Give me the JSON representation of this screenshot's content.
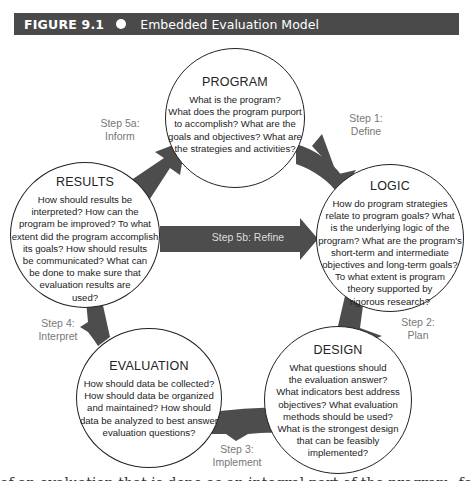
{
  "header": {
    "figure_label": "FIGURE 9.1",
    "bullet_icon": "circle-bullet",
    "title": "Embedded Evaluation Model",
    "background_color": "#4a4a4a"
  },
  "nodes": {
    "program": {
      "title": "PROGRAM",
      "lines": [
        "What is the program?",
        "What does the program purport",
        "to accomplish? What are the",
        "goals and objectives? What are",
        "the strategies and activities?"
      ]
    },
    "logic": {
      "title": "LOGIC",
      "lines": [
        "How do program strategies",
        "relate to program goals? What",
        "is the underlying logic of the",
        "program? What are the program's",
        "short-term and intermediate",
        "objectives and long-term goals?",
        "To what extent is program",
        "theory supported by",
        "rigorous research?"
      ]
    },
    "design": {
      "title": "DESIGN",
      "lines": [
        "What questions should",
        "the evaluation answer?",
        "What indicators best address",
        "objectives? What evaluation",
        "methods should be used?",
        "What is the strongest design",
        "that can be feasibly",
        "implemented?"
      ]
    },
    "evaluation": {
      "title": "EVALUATION",
      "lines": [
        "How should data be collected?",
        "How should data be organized",
        "and maintained? How should",
        "data be analyzed to best answer",
        "evaluation questions?"
      ]
    },
    "results": {
      "title": "RESULTS",
      "lines": [
        "How should results be",
        "interpreted? How can the",
        "program be improved? To what",
        "extent did the program accomplish",
        "its goals? How should results",
        "be communicated? What can",
        "be done to make sure that",
        "evaluation results are",
        "used?"
      ]
    }
  },
  "steps": {
    "step1": {
      "line1": "Step 1:",
      "line2": "Define"
    },
    "step2": {
      "line1": "Step 2:",
      "line2": "Plan"
    },
    "step3": {
      "line1": "Step 3:",
      "line2": "Implement"
    },
    "step4": {
      "line1": "Step 4:",
      "line2": "Interpret"
    },
    "step5a": {
      "line1": "Step 5a:",
      "line2": "Inform"
    },
    "step5b": {
      "label": "Step 5b: Refine"
    }
  },
  "colors": {
    "arrow": "#4d4d4d",
    "step_text": "#777777",
    "circle_border": "#222222"
  },
  "footer": {
    "cut_text": "of an evaluation that is done as an integral part of the program, following the evaluation"
  }
}
